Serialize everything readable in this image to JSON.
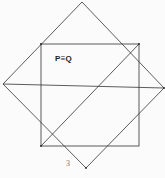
{
  "figure": {
    "label_main": "P≡Q",
    "label_number": "3",
    "line_color": "#333333",
    "background": "#fbfbfb",
    "square": {
      "x1": 41,
      "y1": 44,
      "x2": 139,
      "y2": 146
    },
    "diamond": {
      "top": [
        82,
        2
      ],
      "right": [
        164,
        88
      ],
      "bottom": [
        86,
        168
      ],
      "left": [
        3,
        84
      ]
    },
    "horizontal_line": {
      "from": [
        3,
        84
      ],
      "to": [
        164,
        88
      ]
    },
    "diagonal_line": {
      "from": [
        41,
        146
      ],
      "to": [
        139,
        44
      ]
    }
  }
}
